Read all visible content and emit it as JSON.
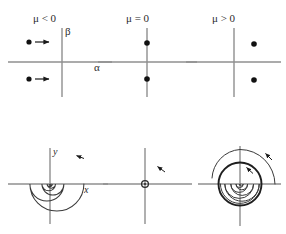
{
  "figure": {
    "name": "hopf-bifurcation-diagram",
    "width": 286,
    "height": 234,
    "background": "#ffffff",
    "axis_color": "#8a8a8a",
    "curve_color": "#3a3a3a",
    "marker_color": "#111111"
  },
  "top_row": {
    "description": "Eigenvalue positions in the complex plane",
    "panels": [
      {
        "title": "μ < 0",
        "axis_x_label": "α",
        "axis_y_label": "β",
        "eigenvalues": [
          {
            "x": -0.55,
            "y": 0.55,
            "arrow": "right"
          },
          {
            "x": -0.55,
            "y": -0.55,
            "arrow": "right"
          }
        ]
      },
      {
        "title": "μ = 0",
        "axis_x_label": "",
        "axis_y_label": "",
        "eigenvalues": [
          {
            "x": 0.0,
            "y": 0.55,
            "arrow": "none"
          },
          {
            "x": 0.0,
            "y": -0.55,
            "arrow": "none"
          }
        ]
      },
      {
        "title": "μ > 0",
        "axis_x_label": "",
        "axis_y_label": "",
        "eigenvalues": [
          {
            "x": 0.55,
            "y": 0.55,
            "arrow": "none"
          },
          {
            "x": 0.55,
            "y": -0.55,
            "arrow": "none"
          }
        ]
      }
    ]
  },
  "bottom_row": {
    "description": "Corresponding phase portraits in the (x, y) plane",
    "panels": [
      {
        "portrait": "stable-spiral",
        "axis_x_label": "x",
        "axis_y_label": "y",
        "direction": "counterclockwise",
        "arrowheads": 1,
        "limit_cycle": false
      },
      {
        "portrait": "degenerate-center",
        "axis_x_label": "",
        "axis_y_label": "",
        "direction": "counterclockwise",
        "arrowheads": 1,
        "limit_cycle": false
      },
      {
        "portrait": "unstable-spiral-with-limit-cycle",
        "axis_x_label": "",
        "axis_y_label": "",
        "direction": "counterclockwise",
        "arrowheads": 2,
        "limit_cycle": true
      }
    ]
  }
}
